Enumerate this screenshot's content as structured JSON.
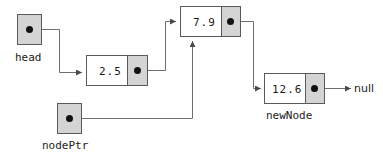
{
  "diagram": {
    "colors": {
      "node_fill": "#ffffff",
      "pointer_fill": "#d4d4d4",
      "border": "#5a5a5a",
      "dot": "#111111",
      "line": "#6e6e6e",
      "text": "#1a1a1a"
    },
    "pointer_variables": [
      {
        "id": "head",
        "label": "head"
      },
      {
        "id": "nodePtr",
        "label": "nodePtr"
      }
    ],
    "nodes": [
      {
        "id": "node-2-5",
        "value": "2.5",
        "label": ""
      },
      {
        "id": "node-7-9",
        "value": "7.9",
        "label": ""
      },
      {
        "id": "node-12-6",
        "value": "12.6",
        "label": "newNode"
      }
    ],
    "terminator": {
      "label": "null"
    },
    "links": [
      {
        "from": "head",
        "to": "node-2-5"
      },
      {
        "from": "node-2-5",
        "to": "node-7-9"
      },
      {
        "from": "node-7-9",
        "to": "node-12-6"
      },
      {
        "from": "nodePtr",
        "to": "node-7-9"
      },
      {
        "from": "node-12-6",
        "to": "null"
      }
    ]
  }
}
